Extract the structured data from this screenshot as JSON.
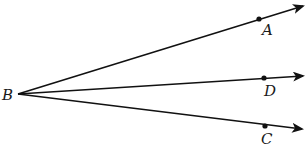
{
  "diagram": {
    "type": "rays-from-common-vertex",
    "vertex": {
      "label": "B",
      "x": 18,
      "y": 94,
      "label_x": 2,
      "label_y": 100
    },
    "rays": [
      {
        "name": "BA",
        "end": {
          "x": 303,
          "y": 6
        },
        "point": {
          "label": "A",
          "x": 259,
          "y": 19,
          "label_x": 262,
          "label_y": 35
        }
      },
      {
        "name": "BD",
        "end": {
          "x": 303,
          "y": 76
        },
        "point": {
          "label": "D",
          "x": 264,
          "y": 78,
          "label_x": 264,
          "label_y": 96
        }
      },
      {
        "name": "BC",
        "end": {
          "x": 302,
          "y": 129
        },
        "point": {
          "label": "C",
          "x": 265,
          "y": 126,
          "label_x": 261,
          "label_y": 144
        }
      }
    ],
    "colors": {
      "stroke": "#111111",
      "background": "#ffffff"
    }
  }
}
